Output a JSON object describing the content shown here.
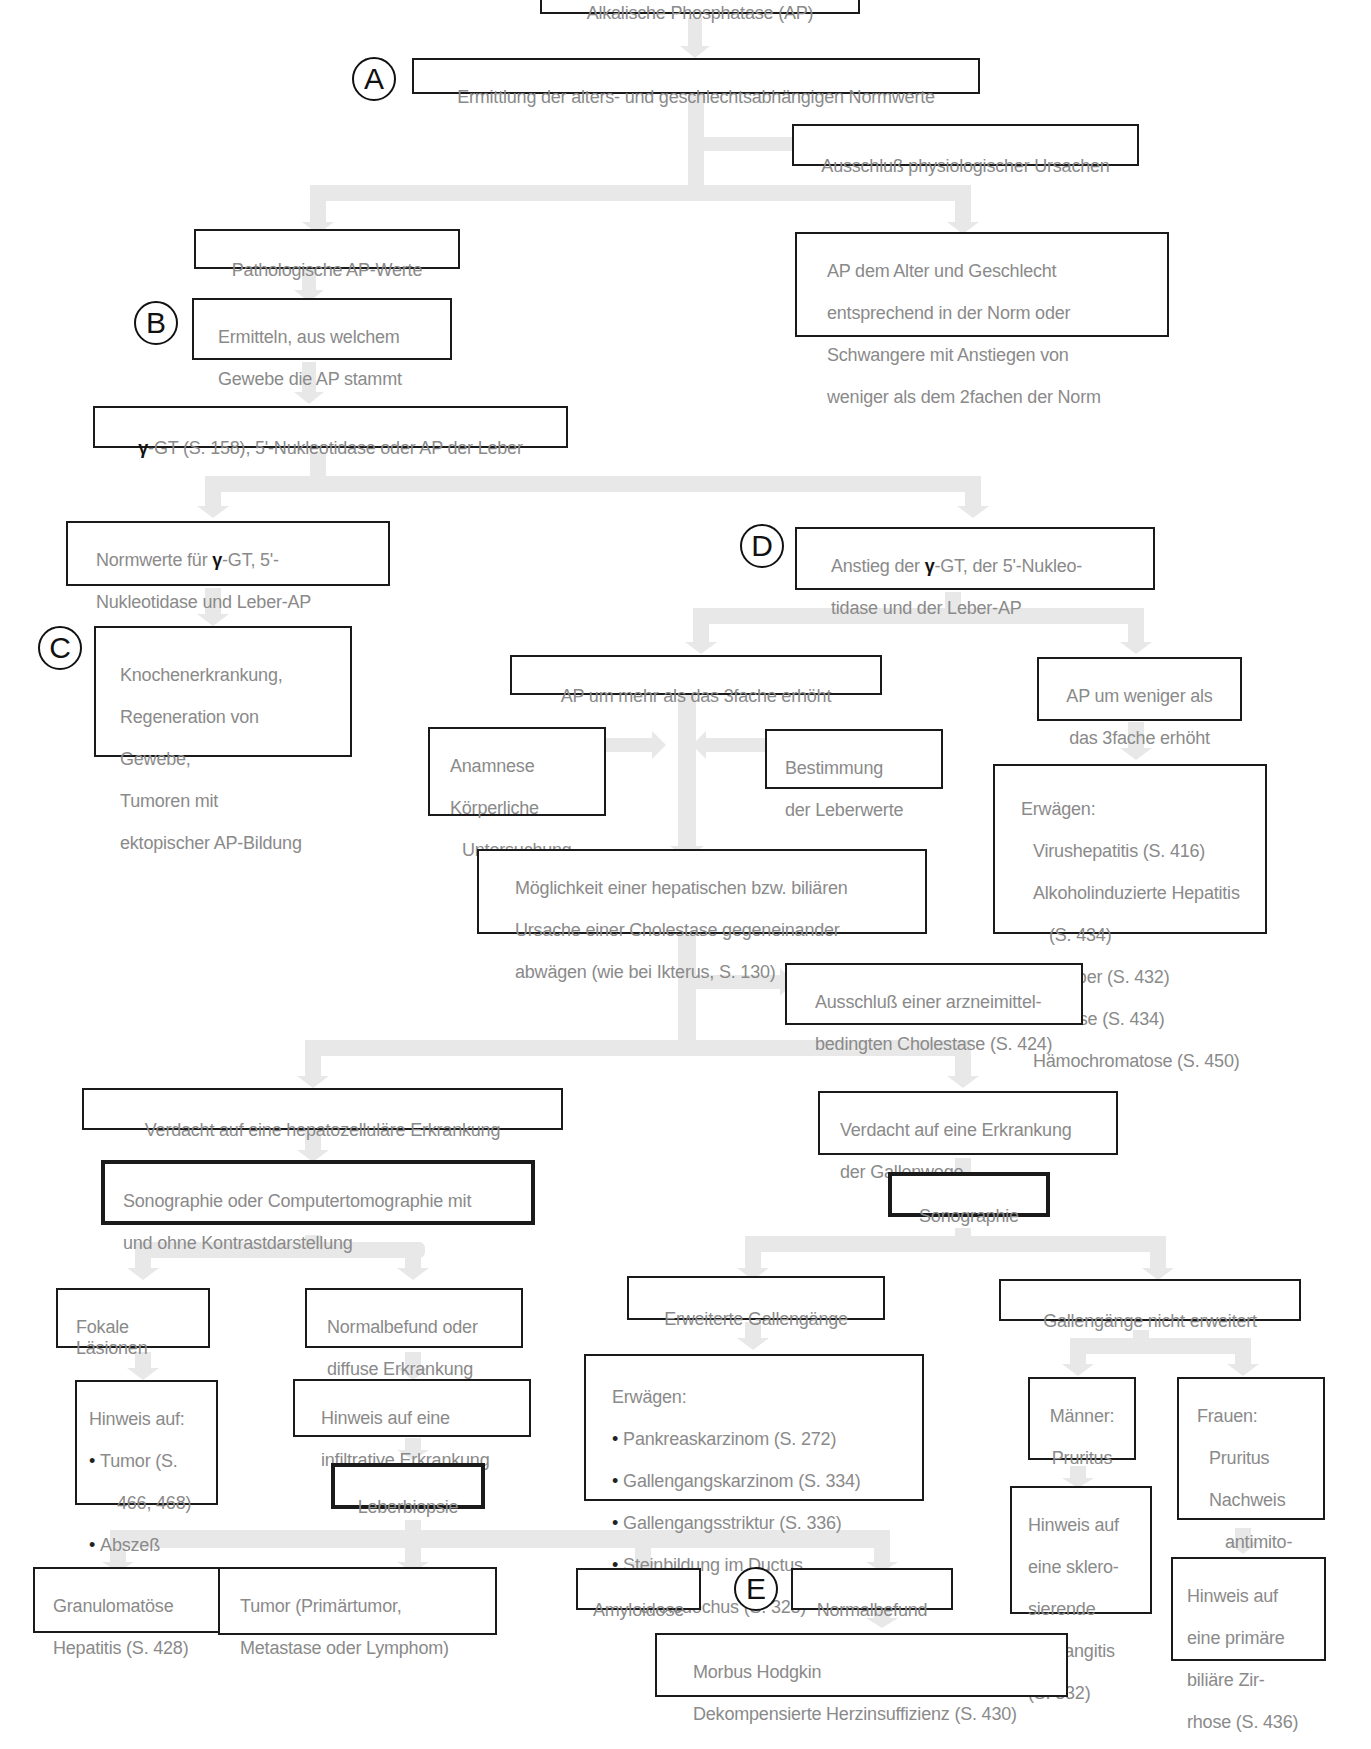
{
  "diagram": {
    "title_box_partial": "Alkalische Phosphatase (AP)",
    "colors": {
      "box_border": "#1a1a1a",
      "box_text": "#8a8a8a",
      "connector": "#e6e6e6",
      "marker": "#111111"
    },
    "markers": {
      "A": "A",
      "B": "B",
      "C": "C",
      "D": "D",
      "E": "E"
    },
    "nodes": {
      "ermittlung": "Ermittlung der alters- und geschlechtsabhängigen Normwerte",
      "ausschluss_physio": "Ausschluß physiologischer Ursachen",
      "patho": "Pathologische AP-Werte",
      "norm": [
        "AP dem Alter und Geschlecht",
        "entsprechend in der Norm oder",
        "Schwangere mit Anstiegen von",
        "weniger als dem 2fachen der Norm"
      ],
      "gewebe": [
        "Ermitteln, aus welchem",
        "Gewebe die AP stammt"
      ],
      "ggt": {
        "gamma": "γ",
        "rest": "-GT (S. 158), 5'-Nukleotidase oder AP der Leber"
      },
      "normwerte": {
        "l1_pre": "Normwerte für ",
        "gamma": "γ",
        "l1_post": "-GT, 5'-",
        "l2": "Nukleotidase und Leber-AP"
      },
      "knochen": [
        "Knochenerkrankung,",
        "Regeneration von",
        "Gewebe,",
        "Tumoren mit",
        "ektopischer AP-Bildung"
      ],
      "anstieg": {
        "l1_pre": "Anstieg der ",
        "gamma": "γ",
        "l1_post": "-GT, der 5'-Nukleo-",
        "l2": "tidase und der Leber-AP"
      },
      "mehr3": "AP um mehr als das 3fache erhöht",
      "weniger3": [
        "AP um weniger als",
        "das 3fache erhöht"
      ],
      "anamnese": [
        "Anamnese",
        "Körperliche",
        "Untersuchung"
      ],
      "bestimmung": [
        "Bestimmung",
        "der Leberwerte"
      ],
      "erwaegen1": {
        "head": "Erwägen:",
        "items": [
          "Virushepatitis (S. 416)",
          "Alkoholinduzierte Hepatitis",
          "(S. 434)",
          "Fettleber (S. 432)",
          "Zirrhose (S. 434)",
          "Hämochromatose (S. 450)"
        ]
      },
      "moeglichkeit": [
        "Möglichkeit einer hepatischen bzw. biliären",
        "Ursache einer Cholestase gegeneinander",
        "abwägen (wie bei Ikterus, S. 130)"
      ],
      "arznei": [
        "Ausschluß einer arzneimittel-",
        "bedingten Cholestase (S. 424)"
      ],
      "hepato": "Verdacht auf eine hepatozelluläre Erkrankung",
      "galle": [
        "Verdacht auf eine Erkrankung",
        "der Gallenwege"
      ],
      "sono_ct": [
        "Sonographie oder Computertomographie mit",
        "und ohne Kontrastdarstellung"
      ],
      "sono": "Sonographie",
      "fokal": [
        "Fokale Läsionen",
        "in der Leber"
      ],
      "diffus": [
        "Normalbefund oder",
        "diffuse Erkrankung"
      ],
      "erweitert": "Erweiterte Gallengänge",
      "nicht_erweitert": "Gallengänge nicht erweitert",
      "hinweis_fokal": {
        "head": "Hinweis auf:",
        "items": [
          "Tumor (S.",
          "466, 468)",
          "Abszeß",
          "(S. 464)"
        ]
      },
      "infiltrativ": [
        "Hinweis auf eine",
        "infiltrative Erkrankung"
      ],
      "biopsie": "Leberbiopsie",
      "erwaegen2": {
        "head": "Erwägen:",
        "items": [
          "Pankreaskarzinom (S. 272)",
          "Gallengangskarzinom (S. 334)",
          "Gallengangsstriktur (S. 336)",
          "Steinbildung im Ductus",
          "choledochus (S. 328)"
        ]
      },
      "maenner": [
        "Männer:",
        "Pruritus",
        "Kolitis"
      ],
      "frauen": [
        "Frauen:",
        "Pruritus",
        "Nachweis",
        "antimito-",
        "chondrialer",
        "Antikörper"
      ],
      "skler": [
        "Hinweis auf",
        "eine sklero-",
        "sierende",
        "Cholangitis",
        "(S. 332)"
      ],
      "pbc": [
        "Hinweis auf",
        "eine primäre",
        "biliäre Zir-",
        "rhose (S. 436)"
      ],
      "granulom": [
        "Granulomatöse",
        "Hepatitis (S. 428)"
      ],
      "tumor": [
        "Tumor (Primärtumor,",
        "Metastase oder Lymphom)"
      ],
      "amyloid": "Amyloidose",
      "normalbefund": "Normalbefund",
      "hodgkin": [
        "Morbus Hodgkin",
        "Dekompensierte Herzinsuffizienz (S. 430)"
      ]
    }
  }
}
